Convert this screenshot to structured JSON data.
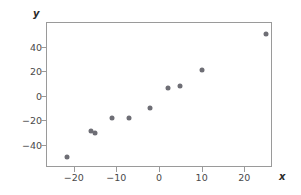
{
  "chart_data": {
    "type": "scatter",
    "title": "",
    "xlabel": "x",
    "ylabel": "y",
    "x": [
      -21.5,
      -16,
      -15,
      -11,
      -7,
      -2,
      2,
      5,
      10,
      25
    ],
    "y": [
      -50,
      -29,
      -30,
      -18,
      -18,
      -10,
      6,
      8,
      21,
      50
    ],
    "points": [
      {
        "x": -21.5,
        "y": -50
      },
      {
        "x": -16,
        "y": -29
      },
      {
        "x": -15,
        "y": -30
      },
      {
        "x": -11,
        "y": -18
      },
      {
        "x": -7,
        "y": -18
      },
      {
        "x": -2,
        "y": -10
      },
      {
        "x": 2,
        "y": 6
      },
      {
        "x": 5,
        "y": 8
      },
      {
        "x": 10,
        "y": 21
      },
      {
        "x": 25,
        "y": 50
      }
    ],
    "xticks": [
      -20,
      -10,
      0,
      10,
      20
    ],
    "xtick_labels": [
      "−20",
      "−10",
      "0",
      "10",
      "20"
    ],
    "yticks": [
      40,
      20,
      0,
      -20,
      -40
    ],
    "ytick_labels": [
      "40",
      "20",
      "0",
      "−20",
      "−40"
    ],
    "xlim": [
      -26.5,
      26.5
    ],
    "ylim": [
      -58,
      60
    ],
    "grid": false,
    "legend": null,
    "marker_color": "#6e6e75",
    "frame_color": "#9a9a9a"
  },
  "axes": {
    "x_title": "x",
    "y_title": "y"
  }
}
